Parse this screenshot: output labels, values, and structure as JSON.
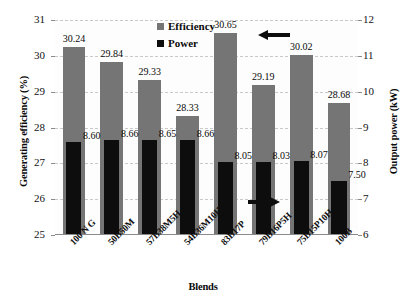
{
  "chart_data": {
    "type": "bar",
    "title": "",
    "xlabel": "Blends",
    "ylabel": "Generating efficiency (%)",
    "y2label": "Output power (kW)",
    "ylim": [
      25,
      31
    ],
    "y2lim": [
      6,
      12
    ],
    "grid": true,
    "legend_position": "top-center",
    "categories": [
      "100 N G",
      "50B50M",
      "57B38M5H",
      "54B36M10H",
      "83B17P",
      "79B16P5H",
      "75B15P10H",
      "100B"
    ],
    "yticks": [
      25,
      26,
      27,
      28,
      29,
      30,
      31
    ],
    "y2ticks": [
      6,
      7,
      8,
      9,
      10,
      11,
      12
    ],
    "series": [
      {
        "name": "Efficiency",
        "axis": "left",
        "unit": "%",
        "color": "#757575",
        "values": [
          30.24,
          29.84,
          29.33,
          28.33,
          30.65,
          29.19,
          30.02,
          28.68
        ],
        "labels": [
          "30.24",
          "29.84",
          "29.33",
          "28.33",
          "30.65",
          "29.19",
          "30.02",
          "28.68"
        ]
      },
      {
        "name": "Power",
        "axis": "right",
        "unit": "kW",
        "color": "#0d0d0d",
        "values": [
          8.6,
          8.66,
          8.65,
          8.66,
          8.05,
          8.03,
          8.07,
          7.5
        ],
        "labels": [
          "8.60",
          "8.66",
          "8.65",
          "8.66",
          "8.05",
          "8.03",
          "8.07",
          "7.50"
        ]
      }
    ],
    "annotations": [
      {
        "name": "arrow-to-left-axis",
        "direction": "left"
      },
      {
        "name": "arrow-to-right-axis",
        "direction": "right"
      }
    ]
  },
  "legend": {
    "items": [
      {
        "label": "Efficiency",
        "color": "#757575"
      },
      {
        "label": "Power",
        "color": "#0d0d0d"
      }
    ]
  }
}
